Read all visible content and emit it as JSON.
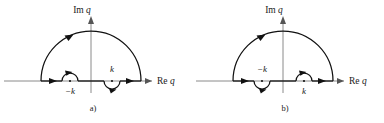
{
  "figure": {
    "panels": [
      {
        "id": "a",
        "caption": "a)",
        "imaginary_axis_label_re": "Im",
        "imaginary_axis_label_var": "q",
        "real_axis_label_re": "Re",
        "real_axis_label_var": "q",
        "pole_left_label": "−k",
        "pole_right_label": "k",
        "pole_left_detour": "above",
        "pole_right_detour": "below",
        "contour_direction": "counterclockwise",
        "contour_shape": "semicircular arc in upper half plane closed along real axis"
      },
      {
        "id": "b",
        "caption": "b)",
        "imaginary_axis_label_re": "Im",
        "imaginary_axis_label_var": "q",
        "real_axis_label_re": "Re",
        "real_axis_label_var": "q",
        "pole_left_label": "−k",
        "pole_right_label": "k",
        "pole_left_detour": "below",
        "pole_right_detour": "above",
        "contour_direction": "counterclockwise",
        "contour_shape": "semicircular arc in upper half plane closed along real axis"
      }
    ],
    "colors": {
      "contour": "#111111",
      "axis": "#8a8a8a",
      "label": "#1a1a1a",
      "background": "#ffffff"
    }
  }
}
